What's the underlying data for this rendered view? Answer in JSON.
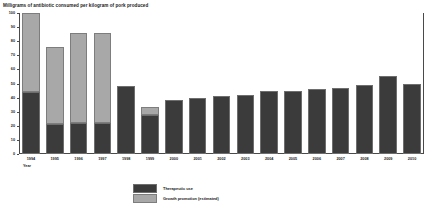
{
  "chart_data": {
    "type": "bar",
    "title": "Milligrams of antibiotic consumed per kilogram of pork produced",
    "xlabel": "Year",
    "ylabel": "",
    "ylim": [
      0,
      100
    ],
    "yticks": [
      100,
      90,
      80,
      70,
      60,
      50,
      40,
      30,
      20,
      10,
      0
    ],
    "grid": false,
    "stacked": true,
    "legend_position": "bottom-center",
    "categories": [
      "1994",
      "1995",
      "1996",
      "1997",
      "1998",
      "1999",
      "2000",
      "2001",
      "2002",
      "2003",
      "2004",
      "2005",
      "2006",
      "2007",
      "2008",
      "2009",
      "2010"
    ],
    "series": [
      {
        "name": "Therapeutic use",
        "color": "#3b3b3b",
        "values": [
          44,
          21,
          22,
          22,
          48,
          28,
          38,
          40,
          41,
          42,
          45,
          45,
          46,
          47,
          49,
          55,
          50
        ]
      },
      {
        "name": "Growth promotion (estimated)",
        "color": "#a8a8a8",
        "values": [
          56,
          55,
          64,
          64,
          0,
          5,
          0,
          0,
          0,
          0,
          0,
          0,
          0,
          0,
          0,
          0,
          0
        ]
      }
    ],
    "totals": [
      100,
      76,
      86,
      86,
      48,
      33,
      38,
      40,
      41,
      42,
      45,
      45,
      46,
      47,
      49,
      55,
      50
    ]
  },
  "legend": {
    "items": [
      {
        "label": "Therapeutic use"
      },
      {
        "label": "Growth promotion (estimated)"
      }
    ]
  }
}
